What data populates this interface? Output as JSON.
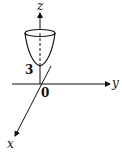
{
  "figure": {
    "type": "3d-axes-paraboloid",
    "axes": {
      "z_label": "z",
      "y_label": "y",
      "x_label": "x"
    },
    "origin_label": "0",
    "vertex_label": "3",
    "surface": "paraboloid opening upward along z-axis, vertex at z = 3"
  },
  "colors": {
    "ink": "#111111",
    "background": "#ffffff"
  }
}
